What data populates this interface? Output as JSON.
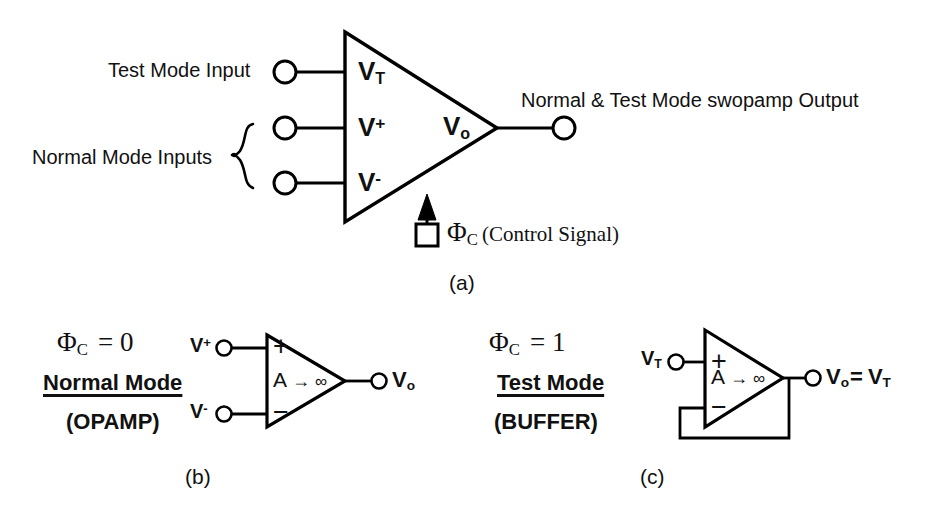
{
  "figure": {
    "panel_a": {
      "caption": "(a)",
      "input_labels": {
        "test_mode": "Test Mode Input",
        "normal_mode": "Normal Mode Inputs"
      },
      "terminal_labels": {
        "test": "V",
        "test_sub": "T",
        "plus": "V",
        "plus_sup": "+",
        "minus": "V",
        "minus_sup": "-",
        "out": "V",
        "out_sub": "o"
      },
      "output_label": "Normal & Test Mode swopamp Output",
      "control": {
        "symbol": "Φ",
        "subscript": "C",
        "note": "(Control Signal)"
      }
    },
    "panel_b": {
      "caption": "(b)",
      "condition_symbol": "Φ",
      "condition_subscript": "C",
      "condition_value": "= 0",
      "mode_title": "Normal Mode",
      "mode_subtitle": "(OPAMP)",
      "input_plus": "V",
      "input_plus_sup": "+",
      "input_minus": "V",
      "input_minus_sup": "-",
      "gain_label": "A",
      "gain_arrow": "→",
      "gain_infinity": "∞",
      "terminal_plus": "+",
      "terminal_minus": "−",
      "output": "V",
      "output_sub": "o"
    },
    "panel_c": {
      "caption": "(c)",
      "condition_symbol": "Φ",
      "condition_subscript": "C",
      "condition_value": "= 1",
      "mode_title": "Test Mode",
      "mode_subtitle": "(BUFFER)",
      "input_label": "V",
      "input_sub": "T",
      "gain_label": "A",
      "gain_arrow": "→",
      "gain_infinity": "∞",
      "terminal_plus": "+",
      "terminal_minus": "−",
      "output": "V",
      "output_sub": "o",
      "output_equals": "=",
      "output_value": "V",
      "output_value_sub": "T"
    },
    "colors": {
      "stroke": "#000000",
      "background": "#ffffff",
      "text": "#111111"
    }
  }
}
